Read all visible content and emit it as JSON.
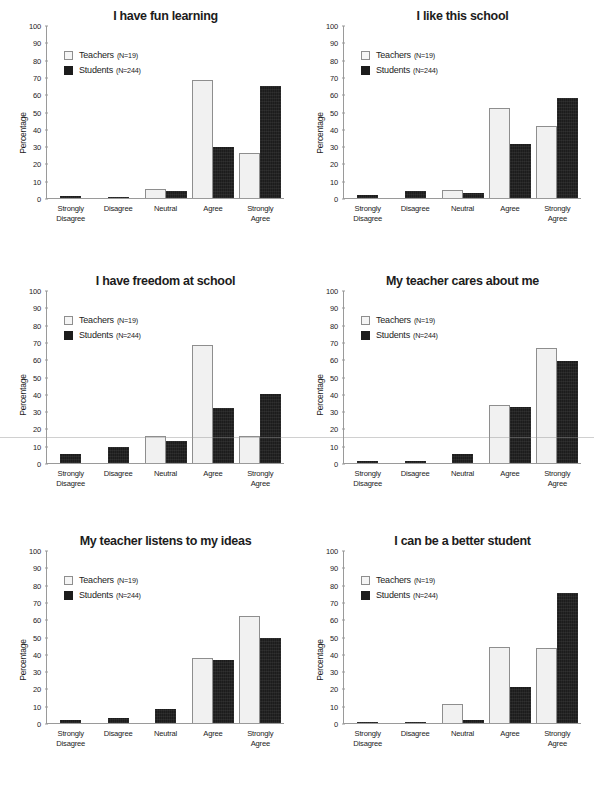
{
  "figure": {
    "legend": {
      "teachers_label": "Teachers",
      "teachers_n": "(N=19)",
      "students_label": "Students",
      "students_n": "(N=244)",
      "teachers_color": "#f1f1f1",
      "students_color": "#1c1c1c"
    },
    "categories": [
      "Strongly\nDisagree",
      "Disagree",
      "Neutral",
      "Agree",
      "Strongly\nAgree"
    ],
    "ylabel": "Percentage",
    "yticks": [
      0,
      10,
      20,
      30,
      40,
      50,
      60,
      70,
      80,
      90,
      100
    ]
  },
  "chart_data": [
    {
      "type": "bar",
      "title": "I have fun learning",
      "categories": [
        "Strongly Disagree",
        "Disagree",
        "Neutral",
        "Agree",
        "Strongly Agree"
      ],
      "series": [
        {
          "name": "Teachers (N=19)",
          "values": [
            0,
            0,
            5,
            68,
            26
          ]
        },
        {
          "name": "Students (N=244)",
          "values": [
            1,
            0.5,
            4,
            29.5,
            64.5
          ]
        }
      ],
      "xlabel": "",
      "ylabel": "Percentage",
      "ylim": [
        0,
        100
      ],
      "grid": false,
      "legend_position": "top-left"
    },
    {
      "type": "bar",
      "title": "I like this school",
      "categories": [
        "Strongly Disagree",
        "Disagree",
        "Neutral",
        "Agree",
        "Strongly Agree"
      ],
      "series": [
        {
          "name": "Teachers (N=19)",
          "values": [
            0,
            0,
            4.5,
            52,
            41.5
          ]
        },
        {
          "name": "Students (N=244)",
          "values": [
            2,
            4,
            3,
            31,
            58
          ]
        }
      ],
      "xlabel": "",
      "ylabel": "Percentage",
      "ylim": [
        0,
        100
      ],
      "grid": false,
      "legend_position": "top-left"
    },
    {
      "type": "bar",
      "title": "I have freedom at school",
      "categories": [
        "Strongly Disagree",
        "Disagree",
        "Neutral",
        "Agree",
        "Strongly Agree"
      ],
      "series": [
        {
          "name": "Teachers (N=19)",
          "values": [
            0,
            0,
            15.5,
            68,
            15.5
          ]
        },
        {
          "name": "Students (N=244)",
          "values": [
            5,
            9,
            13,
            32,
            40
          ]
        }
      ],
      "xlabel": "",
      "ylabel": "Percentage",
      "ylim": [
        0,
        100
      ],
      "grid": false,
      "legend_position": "top-left"
    },
    {
      "type": "bar",
      "title": "My teacher cares about me",
      "categories": [
        "Strongly Disagree",
        "Disagree",
        "Neutral",
        "Agree",
        "Strongly Agree"
      ],
      "series": [
        {
          "name": "Teachers (N=19)",
          "values": [
            0,
            0,
            0,
            33.5,
            66.5
          ]
        },
        {
          "name": "Students (N=244)",
          "values": [
            1,
            1,
            5,
            32.5,
            59
          ]
        }
      ],
      "xlabel": "",
      "ylabel": "Percentage",
      "ylim": [
        0,
        100
      ],
      "grid": false,
      "legend_position": "top-left"
    },
    {
      "type": "bar",
      "title": "My teacher listens to my ideas",
      "categories": [
        "Strongly Disagree",
        "Disagree",
        "Neutral",
        "Agree",
        "Strongly Agree"
      ],
      "series": [
        {
          "name": "Teachers (N=19)",
          "values": [
            0,
            0,
            0,
            37.5,
            62
          ]
        },
        {
          "name": "Students (N=244)",
          "values": [
            1.5,
            3,
            8,
            36.5,
            49
          ]
        }
      ],
      "xlabel": "",
      "ylabel": "Percentage",
      "ylim": [
        0,
        100
      ],
      "grid": false,
      "legend_position": "top-left"
    },
    {
      "type": "bar",
      "title": "I can be a better student",
      "categories": [
        "Strongly Disagree",
        "Disagree",
        "Neutral",
        "Agree",
        "Strongly Agree"
      ],
      "series": [
        {
          "name": "Teachers (N=19)",
          "values": [
            0,
            0,
            11,
            44,
            43.5
          ]
        },
        {
          "name": "Students (N=244)",
          "values": [
            0.8,
            0.8,
            1.5,
            21,
            75
          ]
        }
      ],
      "xlabel": "",
      "ylabel": "Percentage",
      "ylim": [
        0,
        100
      ],
      "grid": false,
      "legend_position": "top-left"
    }
  ]
}
